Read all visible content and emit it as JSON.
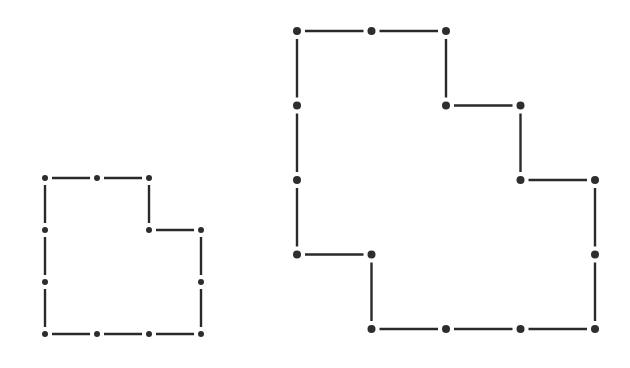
{
  "diagram": {
    "colors": {
      "line": "#2a2a2a",
      "dot": "#2e2e2e",
      "background": "#ffffff"
    },
    "shapes": [
      {
        "name": "small-shape",
        "grid_origin": [
          45,
          178
        ],
        "grid_step": 52,
        "dot_radius": 3,
        "vertices_grid": [
          [
            0,
            0
          ],
          [
            2,
            0
          ],
          [
            2,
            1
          ],
          [
            3,
            1
          ],
          [
            3,
            3
          ],
          [
            0,
            3
          ]
        ],
        "dots_grid": [
          [
            0,
            0
          ],
          [
            1,
            0
          ],
          [
            2,
            0
          ],
          [
            0,
            1
          ],
          [
            2,
            1
          ],
          [
            3,
            1
          ],
          [
            0,
            2
          ],
          [
            3,
            2
          ],
          [
            0,
            3
          ],
          [
            1,
            3
          ],
          [
            2,
            3
          ],
          [
            3,
            3
          ]
        ]
      },
      {
        "name": "large-shape",
        "grid_origin": [
          297,
          31
        ],
        "grid_step": 74.5,
        "dot_radius": 4,
        "vertices_grid": [
          [
            0,
            0
          ],
          [
            2,
            0
          ],
          [
            2,
            1
          ],
          [
            3,
            1
          ],
          [
            3,
            2
          ],
          [
            4,
            2
          ],
          [
            4,
            4
          ],
          [
            1,
            4
          ],
          [
            1,
            3
          ],
          [
            0,
            3
          ]
        ],
        "dots_grid": [
          [
            0,
            0
          ],
          [
            1,
            0
          ],
          [
            2,
            0
          ],
          [
            0,
            1
          ],
          [
            2,
            1
          ],
          [
            3,
            1
          ],
          [
            0,
            2
          ],
          [
            3,
            2
          ],
          [
            4,
            2
          ],
          [
            0,
            3
          ],
          [
            1,
            3
          ],
          [
            4,
            3
          ],
          [
            1,
            4
          ],
          [
            2,
            4
          ],
          [
            3,
            4
          ],
          [
            4,
            4
          ]
        ]
      }
    ]
  }
}
